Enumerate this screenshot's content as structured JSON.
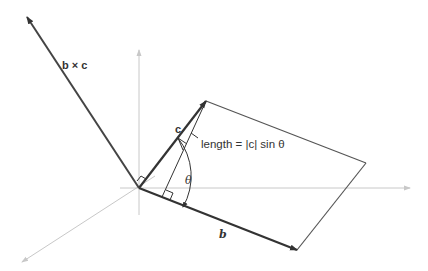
{
  "figure": {
    "labels": {
      "cross_product": "b × c",
      "vector_b": "b",
      "vector_c": "c",
      "angle": "θ",
      "height_annotation": "length = |c| sin θ"
    },
    "colors": {
      "vector": "#333333",
      "axis": "#c8c8c8",
      "parallelogram": "#555555"
    },
    "points": {
      "origin": [
        139,
        188
      ],
      "b_tip": [
        297,
        250
      ],
      "c_tip": [
        206,
        101
      ],
      "far_corner": [
        366,
        163
      ],
      "bxc_tip": [
        27,
        17
      ]
    }
  }
}
